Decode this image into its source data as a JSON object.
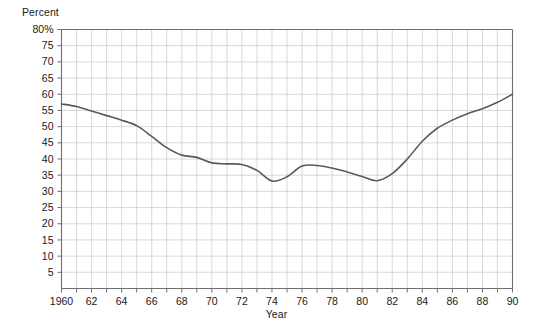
{
  "chart_data": {
    "type": "line",
    "title": "",
    "xlabel": "Year",
    "ylabel": "Percent",
    "ylim": [
      0,
      80
    ],
    "xlim": [
      1960,
      1990
    ],
    "ytick_values": [
      5,
      10,
      15,
      20,
      25,
      30,
      35,
      40,
      45,
      50,
      55,
      60,
      65,
      70,
      75,
      80
    ],
    "ytick_labels": [
      "5",
      "10",
      "15",
      "20",
      "25",
      "30",
      "35",
      "40",
      "45",
      "50",
      "55",
      "60",
      "65",
      "70",
      "75",
      "80%"
    ],
    "xtick_values": [
      1960,
      1961,
      1962,
      1963,
      1964,
      1965,
      1966,
      1967,
      1968,
      1969,
      1970,
      1971,
      1972,
      1973,
      1974,
      1975,
      1976,
      1977,
      1978,
      1979,
      1980,
      1981,
      1982,
      1983,
      1984,
      1985,
      1986,
      1987,
      1988,
      1989,
      1990
    ],
    "xtick_labels_major": {
      "1960": "1960",
      "1962": "62",
      "1964": "64",
      "1966": "66",
      "1968": "68",
      "1970": "70",
      "1972": "72",
      "1974": "74",
      "1976": "76",
      "1978": "78",
      "1980": "80",
      "1982": "82",
      "1984": "84",
      "1986": "86",
      "1988": "88",
      "1990": "90"
    },
    "grid": true,
    "legend": "none",
    "line_color": "#595959",
    "grid_color": "#c8c8c8",
    "axis_color": "#6e6e6e",
    "x": [
      1960,
      1961,
      1962,
      1963,
      1964,
      1965,
      1966,
      1967,
      1968,
      1969,
      1970,
      1971,
      1972,
      1973,
      1974,
      1975,
      1976,
      1977,
      1978,
      1979,
      1980,
      1981,
      1982,
      1983,
      1984,
      1985,
      1986,
      1987,
      1988,
      1989,
      1990
    ],
    "values": [
      57.0,
      56.2,
      54.8,
      53.4,
      52.0,
      50.3,
      47.0,
      43.5,
      41.2,
      40.5,
      38.8,
      38.5,
      38.3,
      36.5,
      33.2,
      34.5,
      37.8,
      38.0,
      37.2,
      36.0,
      34.6,
      33.3,
      35.5,
      40.0,
      45.5,
      49.5,
      52.0,
      54.0,
      55.5,
      57.5,
      60.0
    ]
  }
}
